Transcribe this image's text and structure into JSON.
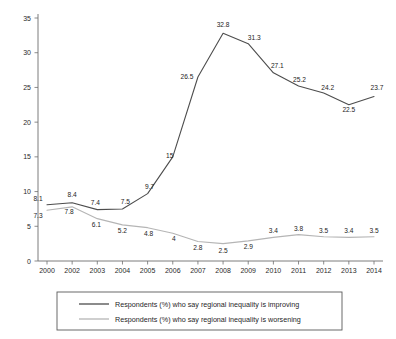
{
  "chart_data": {
    "type": "line",
    "title": "",
    "subtitle": "",
    "xlabel": "",
    "ylabel": "",
    "xlim": [
      0,
      14
    ],
    "ylim": [
      0,
      35
    ],
    "y_ticks": [
      0,
      5,
      10,
      15,
      20,
      25,
      30,
      35
    ],
    "grid": false,
    "legend_position": "bottom",
    "categories": [
      "2000",
      "2002",
      "2003",
      "2004",
      "2005",
      "2006",
      "2007",
      "2008",
      "2009",
      "2010",
      "2011",
      "2012",
      "2013",
      "2014"
    ],
    "x_tick_labels": [
      "2000",
      "2002",
      "2003",
      "2004",
      "2005",
      "2006",
      "2007",
      "2008",
      "2009",
      "2010",
      "2011",
      "2012",
      "2013",
      "2014"
    ],
    "series": [
      {
        "name": "Respondents (%) who say regional inequality is improving",
        "color": "#4d4d4d",
        "values": [
          8.1,
          8.4,
          7.4,
          7.5,
          9.7,
          15,
          26.5,
          32.8,
          31.3,
          27.1,
          25.2,
          24.2,
          22.5,
          23.7
        ],
        "labels": [
          "8.1",
          "8.4",
          "7.4",
          "7.5",
          "9.7",
          "15",
          "26.5",
          "32.8",
          "31.3",
          "27.1",
          "25.2",
          "24.2",
          "22.5",
          "23.7"
        ]
      },
      {
        "name": "Respondents (%) who say regional inequality is worsening",
        "color": "#b5b5b5",
        "values": [
          7.3,
          7.8,
          6.1,
          5.2,
          4.8,
          4,
          2.8,
          2.5,
          2.9,
          3.4,
          3.8,
          3.5,
          3.4,
          3.5
        ],
        "labels": [
          "7.3",
          "7.8",
          "6.1",
          "5.2",
          "4.8",
          "4",
          "2.8",
          "2.5",
          "2.9",
          "3.4",
          "3.8",
          "3.5",
          "3.4",
          "3.5"
        ]
      }
    ]
  },
  "legend": {
    "items": [
      {
        "label": "Respondents (%) who say regional inequality is improving",
        "color": "#4d4d4d"
      },
      {
        "label": "Respondents (%) who say regional inequality is worsening",
        "color": "#b5b5b5"
      }
    ]
  },
  "colors": {
    "improving": "#4d4d4d",
    "worsening": "#b5b5b5",
    "axis": "#6e6e6e",
    "text": "#1f1f1f",
    "background": "#ffffff"
  }
}
